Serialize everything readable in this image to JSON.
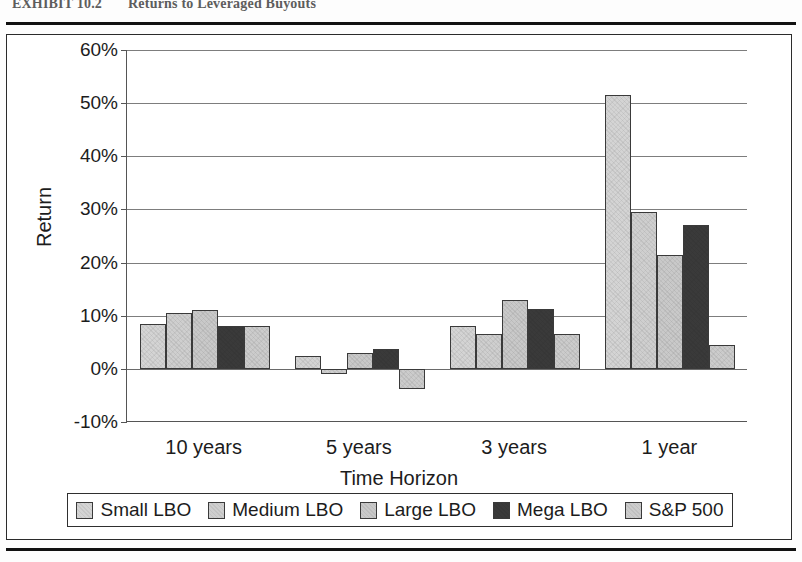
{
  "exhibit": {
    "number": "EXHIBIT 10.2",
    "title": "Returns to Leveraged Buyouts"
  },
  "chart_data": {
    "type": "bar",
    "title": "Returns to Leveraged Buyouts",
    "xlabel": "Time Horizon",
    "ylabel": "Return",
    "categories": [
      "10 years",
      "5 years",
      "3 years",
      "1 year"
    ],
    "ylim": [
      -10,
      60
    ],
    "ytick_labels": [
      "60%",
      "50%",
      "40%",
      "30%",
      "20%",
      "10%",
      "0%",
      "-10%"
    ],
    "ytick_values": [
      60,
      50,
      40,
      30,
      20,
      10,
      0,
      -10
    ],
    "yunit": "percent",
    "grid": true,
    "legend_position": "bottom",
    "series": [
      {
        "name": "Small LBO",
        "color": "#d4d4d4",
        "values": [
          8.5,
          2.5,
          8.0,
          51.5
        ]
      },
      {
        "name": "Medium LBO",
        "color": "#cfcfcf",
        "values": [
          10.5,
          -1.0,
          6.5,
          29.5
        ]
      },
      {
        "name": "Large LBO",
        "color": "#c9c9c9",
        "values": [
          11.0,
          3.0,
          13.0,
          21.5
        ]
      },
      {
        "name": "Mega LBO",
        "color": "#3a3a3a",
        "values": [
          8.0,
          3.7,
          11.3,
          27.0
        ]
      },
      {
        "name": "S&P 500",
        "color": "#cccccc",
        "values": [
          8.0,
          -3.7,
          6.5,
          4.5
        ]
      }
    ]
  }
}
